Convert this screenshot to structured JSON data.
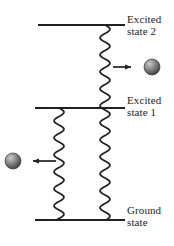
{
  "figure": {
    "kind": "energy-level-diagram",
    "background_color": "#ffffff",
    "width": 174,
    "height": 246
  },
  "levels": [
    {
      "id": "excited-state-2",
      "label_line1": "Excited",
      "label_line2": "state 2",
      "y": 25,
      "x_start": 38,
      "x_end": 125,
      "color": "#231f20"
    },
    {
      "id": "excited-state-1",
      "label_line1": "Excited",
      "label_line2": "state 1",
      "y": 108,
      "x_start": 35,
      "x_end": 125,
      "color": "#231f20"
    },
    {
      "id": "ground-state",
      "label_line1": "Ground",
      "label_line2": "state",
      "y": 220,
      "x_start": 35,
      "x_end": 125,
      "color": "#231f20"
    }
  ],
  "wavy_transitions": [
    {
      "id": "photon-wave-right",
      "x_center": 105,
      "y_top": 25,
      "y_bottom": 220,
      "amplitude": 5,
      "wavelength": 17,
      "color": "#231f20"
    },
    {
      "id": "photon-wave-left",
      "x_center": 59,
      "y_top": 108,
      "y_bottom": 220,
      "amplitude": 5,
      "wavelength": 17,
      "color": "#231f20"
    }
  ],
  "arrows": [
    {
      "id": "emission-arrow-right",
      "direction": "right",
      "x_tail": 113,
      "x_head": 136,
      "y": 67,
      "color": "#231f20"
    },
    {
      "id": "emission-arrow-left",
      "direction": "left",
      "x_tail": 56,
      "x_head": 28,
      "y": 161,
      "color": "#231f20"
    }
  ],
  "particles": [
    {
      "id": "photon-sphere-right",
      "cx": 152,
      "cy": 67,
      "r": 8,
      "fill_light": "#b9b9b9",
      "fill_mid": "#8a8a8a",
      "fill_dark": "#4a4a4a",
      "edge": "#3a3a3a"
    },
    {
      "id": "photon-sphere-left",
      "cx": 13,
      "cy": 161,
      "r": 8,
      "fill_light": "#b9b9b9",
      "fill_mid": "#8a8a8a",
      "fill_dark": "#4a4a4a",
      "edge": "#3a3a3a"
    }
  ],
  "text_color": "#221f20"
}
